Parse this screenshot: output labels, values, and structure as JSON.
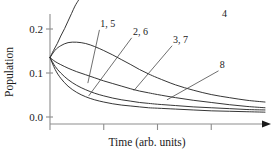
{
  "chart_data": {
    "type": "line",
    "title": "",
    "xlabel": "Time (arb. units)",
    "ylabel": "Population",
    "xlim": [
      0,
      5
    ],
    "ylim": [
      0.0,
      0.25
    ],
    "xticklabels": [
      "",
      "",
      "",
      ""
    ],
    "yticklabels": [
      "0.0",
      "0.1",
      "0.2"
    ],
    "ytickvalues": [
      0.0,
      0.1,
      0.2
    ],
    "xtickvalues": [
      0,
      1.25,
      2.5,
      3.75
    ],
    "grid": false,
    "legend": "inline-curve-labels",
    "xaxis_arrow": true,
    "common_start_value": 0.135,
    "annotations": [
      {
        "text": "4",
        "x": 4.0,
        "y": 0.228
      },
      {
        "text": "1, 5",
        "x": 1.17,
        "y": 0.205
      },
      {
        "text": "2, 6",
        "x": 1.93,
        "y": 0.186
      },
      {
        "text": "3, 7",
        "x": 2.86,
        "y": 0.168
      },
      {
        "text": "8",
        "x": 3.95,
        "y": 0.111
      }
    ],
    "series": [
      {
        "name": "4",
        "label": "4",
        "x": [
          0.0,
          0.08,
          0.17,
          0.25,
          0.34,
          0.42,
          0.5,
          0.58,
          0.66
        ],
        "values": [
          0.135,
          0.151,
          0.167,
          0.184,
          0.201,
          0.218,
          0.235,
          0.252,
          0.265
        ]
      },
      {
        "name": "1, 5",
        "label": "1, 5",
        "x": [
          0.0,
          0.12,
          0.25,
          0.42,
          0.62,
          0.83,
          1.04,
          1.25,
          1.46,
          1.67,
          1.88,
          2.08,
          2.29,
          2.5,
          2.92,
          3.33,
          3.75,
          4.17,
          4.58,
          5.0
        ],
        "values": [
          0.135,
          0.152,
          0.162,
          0.169,
          0.17,
          0.167,
          0.16,
          0.151,
          0.141,
          0.13,
          0.119,
          0.108,
          0.098,
          0.089,
          0.073,
          0.061,
          0.051,
          0.044,
          0.038,
          0.034
        ]
      },
      {
        "name": "2, 6",
        "label": "2, 6",
        "x": [
          0.0,
          0.12,
          0.25,
          0.42,
          0.62,
          0.83,
          1.04,
          1.25,
          1.46,
          1.67,
          1.88,
          2.08,
          2.29,
          2.5,
          2.92,
          3.33,
          3.75,
          4.17,
          4.58,
          5.0
        ],
        "values": [
          0.135,
          0.126,
          0.119,
          0.111,
          0.103,
          0.096,
          0.089,
          0.082,
          0.076,
          0.07,
          0.064,
          0.059,
          0.055,
          0.051,
          0.044,
          0.038,
          0.033,
          0.028,
          0.024,
          0.021
        ]
      },
      {
        "name": "3, 7",
        "label": "3, 7",
        "x": [
          0.0,
          0.12,
          0.25,
          0.42,
          0.62,
          0.83,
          1.04,
          1.25,
          1.46,
          1.67,
          1.88,
          2.08,
          2.29,
          2.5,
          2.92,
          3.33,
          3.75,
          4.17,
          4.58,
          5.0
        ],
        "values": [
          0.135,
          0.115,
          0.1,
          0.085,
          0.072,
          0.062,
          0.054,
          0.048,
          0.043,
          0.039,
          0.036,
          0.033,
          0.031,
          0.029,
          0.026,
          0.023,
          0.021,
          0.019,
          0.017,
          0.016
        ]
      },
      {
        "name": "8",
        "label": "8",
        "x": [
          0.0,
          0.12,
          0.25,
          0.42,
          0.62,
          0.83,
          1.04,
          1.25,
          1.46,
          1.67,
          1.88,
          2.08,
          2.29,
          2.5,
          2.92,
          3.33,
          3.75,
          4.17,
          4.58,
          5.0
        ],
        "values": [
          0.135,
          0.108,
          0.088,
          0.07,
          0.056,
          0.046,
          0.039,
          0.034,
          0.03,
          0.027,
          0.025,
          0.023,
          0.021,
          0.02,
          0.018,
          0.016,
          0.014,
          0.013,
          0.012,
          0.011
        ]
      }
    ],
    "leaders": [
      {
        "for": "1, 5",
        "from_x": 1.15,
        "from_y": 0.198,
        "to_x": 0.88,
        "to_y": 0.077
      },
      {
        "for": "2, 6",
        "from_x": 1.9,
        "from_y": 0.18,
        "to_x": 0.9,
        "to_y": 0.048
      },
      {
        "for": "3, 7",
        "from_x": 2.84,
        "from_y": 0.162,
        "to_x": 1.95,
        "to_y": 0.06
      },
      {
        "for": "8",
        "from_x": 3.92,
        "from_y": 0.105,
        "to_x": 2.72,
        "to_y": 0.039
      }
    ],
    "colors": {
      "curve": "#2b2b2b",
      "axis": "#8d8d8d",
      "text": "#1a1a1a",
      "leader": "#4a4a4a",
      "background": "#ffffff"
    }
  }
}
